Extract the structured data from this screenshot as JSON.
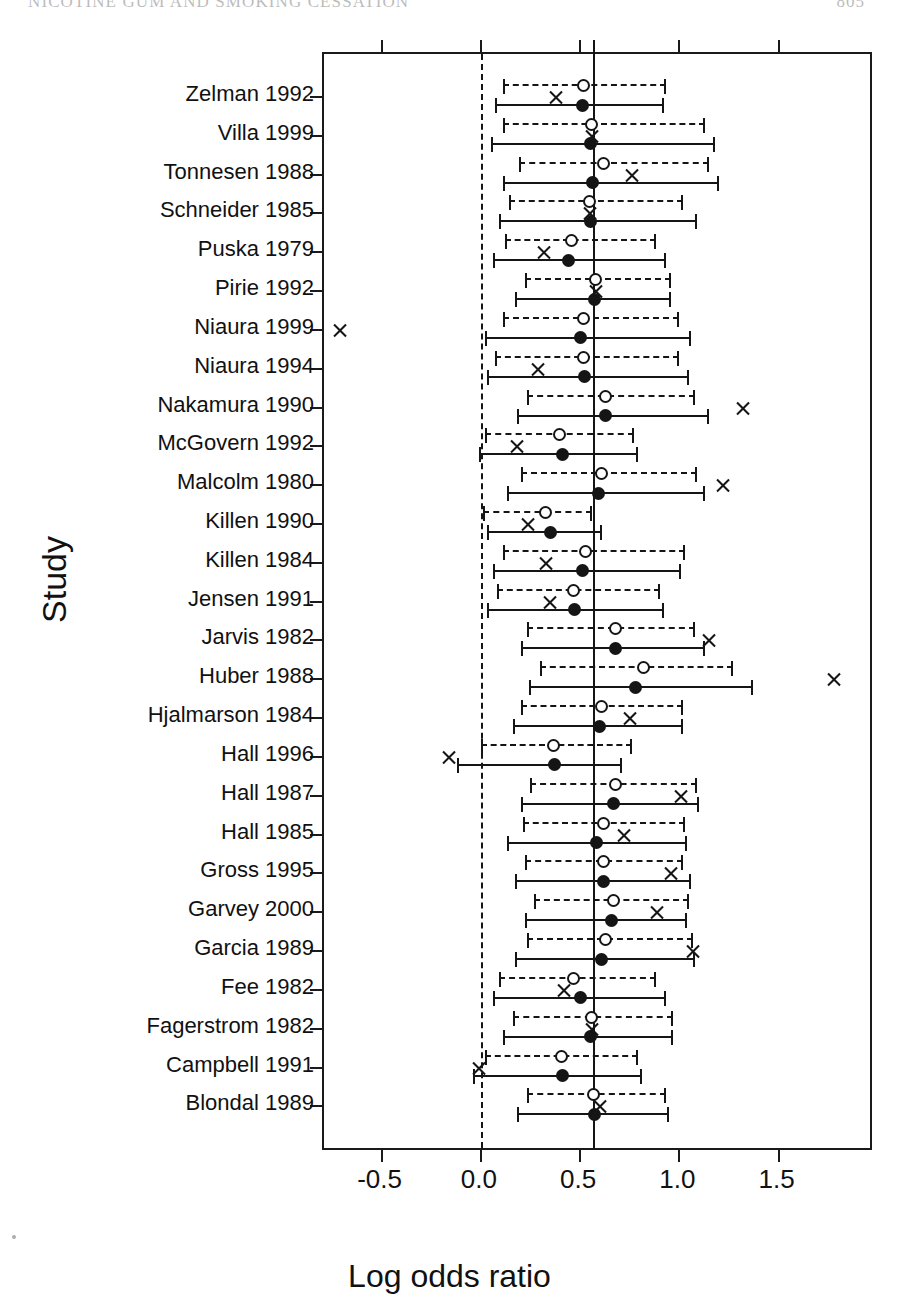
{
  "running_head": {
    "title": "NICOTINE GUM AND SMOKING CESSATION",
    "page": "805"
  },
  "axes": {
    "ylabel": "Study",
    "xlabel": "Log odds ratio",
    "xticks": [
      "-0.5",
      "0.0",
      "0.5",
      "1.0",
      "1.5"
    ],
    "xtick_values": [
      -0.5,
      0.0,
      0.5,
      1.0,
      1.5
    ],
    "xlim": [
      -0.79,
      1.98
    ],
    "reference_line_dashed": 0.0,
    "reference_line_solid": 0.57
  },
  "legend_semantics": {
    "open_circle": "Adjusted / trim-and-fill estimate",
    "filled_circle": "Observed estimate",
    "x_marker": "Influence diagnostic",
    "dashed_line": "Adjusted 95% confidence interval",
    "solid_line": "Observed 95% confidence interval"
  },
  "chart_data": {
    "type": "scatter",
    "title": "",
    "xlabel": "Log odds ratio",
    "ylabel": "Study",
    "xlim": [
      -0.79,
      1.98
    ],
    "grid": false,
    "legend_position": "none",
    "categories": [
      "Zelman 1992",
      "Villa 1999",
      "Tonnesen 1988",
      "Schneider 1985",
      "Puska 1979",
      "Pirie 1992",
      "Niaura 1999",
      "Niaura 1994",
      "Nakamura 1990",
      "McGovern 1992",
      "Malcolm 1980",
      "Killen 1990",
      "Killen 1984",
      "Jensen 1991",
      "Jarvis 1982",
      "Huber 1988",
      "Hjalmarson 1984",
      "Hall 1996",
      "Hall 1987",
      "Hall 1985",
      "Gross 1995",
      "Garvey 2000",
      "Garcia 1989",
      "Fee 1982",
      "Fagerstrom 1982",
      "Campbell 1991",
      "Blondal 1989"
    ],
    "series": [
      {
        "name": "Adjusted estimate (open circle, dashed CI)",
        "marker": "open-circle",
        "line": "dashed",
        "points": [
          {
            "study": "Zelman 1992",
            "est": 0.52,
            "lo": 0.11,
            "hi": 0.93
          },
          {
            "study": "Villa 1999",
            "est": 0.56,
            "lo": 0.11,
            "hi": 1.13
          },
          {
            "study": "Tonnesen 1988",
            "est": 0.62,
            "lo": 0.19,
            "hi": 1.15
          },
          {
            "study": "Schneider 1985",
            "est": 0.55,
            "lo": 0.14,
            "hi": 1.02
          },
          {
            "study": "Puska 1979",
            "est": 0.46,
            "lo": 0.12,
            "hi": 0.88
          },
          {
            "study": "Pirie 1992",
            "est": 0.58,
            "lo": 0.22,
            "hi": 0.96
          },
          {
            "study": "Niaura 1999",
            "est": 0.52,
            "lo": 0.11,
            "hi": 1.0
          },
          {
            "study": "Niaura 1994",
            "est": 0.52,
            "lo": 0.07,
            "hi": 1.0
          },
          {
            "study": "Nakamura 1990",
            "est": 0.63,
            "lo": 0.23,
            "hi": 1.08
          },
          {
            "study": "McGovern 1992",
            "est": 0.4,
            "lo": 0.02,
            "hi": 0.77
          },
          {
            "study": "Malcolm 1980",
            "est": 0.61,
            "lo": 0.2,
            "hi": 1.09
          },
          {
            "study": "Killen 1990",
            "est": 0.33,
            "lo": 0.01,
            "hi": 0.56
          },
          {
            "study": "Killen 1984",
            "est": 0.53,
            "lo": 0.11,
            "hi": 1.03
          },
          {
            "study": "Jensen 1991",
            "est": 0.47,
            "lo": 0.08,
            "hi": 0.9
          },
          {
            "study": "Jarvis 1982",
            "est": 0.68,
            "lo": 0.23,
            "hi": 1.08
          },
          {
            "study": "Huber 1988",
            "est": 0.82,
            "lo": 0.3,
            "hi": 1.27
          },
          {
            "study": "Hjalmarson 1984",
            "est": 0.61,
            "lo": 0.2,
            "hi": 1.02
          },
          {
            "study": "Hall 1996",
            "est": 0.37,
            "lo": 0.0,
            "hi": 0.76
          },
          {
            "study": "Hall 1987",
            "est": 0.68,
            "lo": 0.25,
            "hi": 1.09
          },
          {
            "study": "Hall 1985",
            "est": 0.62,
            "lo": 0.21,
            "hi": 1.03
          },
          {
            "study": "Gross 1995",
            "est": 0.62,
            "lo": 0.22,
            "hi": 1.02
          },
          {
            "study": "Garvey 2000",
            "est": 0.67,
            "lo": 0.27,
            "hi": 1.05
          },
          {
            "study": "Garcia 1989",
            "est": 0.63,
            "lo": 0.23,
            "hi": 1.07
          },
          {
            "study": "Fee 1982",
            "est": 0.47,
            "lo": 0.09,
            "hi": 0.88
          },
          {
            "study": "Fagerstrom 1982",
            "est": 0.56,
            "lo": 0.16,
            "hi": 0.97
          },
          {
            "study": "Campbell 1991",
            "est": 0.41,
            "lo": 0.02,
            "hi": 0.79
          },
          {
            "study": "Blondal 1989",
            "est": 0.57,
            "lo": 0.23,
            "hi": 0.93
          }
        ]
      },
      {
        "name": "Observed estimate (filled circle, solid CI)",
        "marker": "filled-circle",
        "line": "solid",
        "points": [
          {
            "study": "Zelman 1992",
            "est": 0.51,
            "lo": 0.07,
            "hi": 0.92
          },
          {
            "study": "Villa 1999",
            "est": 0.55,
            "lo": 0.05,
            "hi": 1.18
          },
          {
            "study": "Tonnesen 1988",
            "est": 0.56,
            "lo": 0.11,
            "hi": 1.2
          },
          {
            "study": "Schneider 1985",
            "est": 0.55,
            "lo": 0.09,
            "hi": 1.09
          },
          {
            "study": "Puska 1979",
            "est": 0.44,
            "lo": 0.06,
            "hi": 0.93
          },
          {
            "study": "Pirie 1992",
            "est": 0.57,
            "lo": 0.17,
            "hi": 0.96
          },
          {
            "study": "Niaura 1999",
            "est": 0.5,
            "lo": 0.02,
            "hi": 1.06
          },
          {
            "study": "Niaura 1994",
            "est": 0.52,
            "lo": 0.03,
            "hi": 1.05
          },
          {
            "study": "Nakamura 1990",
            "est": 0.63,
            "lo": 0.18,
            "hi": 1.15
          },
          {
            "study": "McGovern 1992",
            "est": 0.41,
            "lo": -0.01,
            "hi": 0.79
          },
          {
            "study": "Malcolm 1980",
            "est": 0.59,
            "lo": 0.13,
            "hi": 1.13
          },
          {
            "study": "Killen 1990",
            "est": 0.35,
            "lo": 0.03,
            "hi": 0.61
          },
          {
            "study": "Killen 1984",
            "est": 0.51,
            "lo": 0.06,
            "hi": 1.01
          },
          {
            "study": "Jensen 1991",
            "est": 0.47,
            "lo": 0.03,
            "hi": 0.92
          },
          {
            "study": "Jarvis 1982",
            "est": 0.68,
            "lo": 0.2,
            "hi": 1.13
          },
          {
            "study": "Huber 1988",
            "est": 0.78,
            "lo": 0.24,
            "hi": 1.37
          },
          {
            "study": "Hjalmarson 1984",
            "est": 0.6,
            "lo": 0.16,
            "hi": 1.02
          },
          {
            "study": "Hall 1996",
            "est": 0.37,
            "lo": -0.12,
            "hi": 0.71
          },
          {
            "study": "Hall 1987",
            "est": 0.67,
            "lo": 0.2,
            "hi": 1.1
          },
          {
            "study": "Hall 1985",
            "est": 0.58,
            "lo": 0.13,
            "hi": 1.04
          },
          {
            "study": "Gross 1995",
            "est": 0.62,
            "lo": 0.17,
            "hi": 1.06
          },
          {
            "study": "Garvey 2000",
            "est": 0.66,
            "lo": 0.22,
            "hi": 1.04
          },
          {
            "study": "Garcia 1989",
            "est": 0.61,
            "lo": 0.17,
            "hi": 1.08
          },
          {
            "study": "Fee 1982",
            "est": 0.5,
            "lo": 0.06,
            "hi": 0.93
          },
          {
            "study": "Fagerstrom 1982",
            "est": 0.55,
            "lo": 0.11,
            "hi": 0.97
          },
          {
            "study": "Campbell 1991",
            "est": 0.41,
            "lo": -0.04,
            "hi": 0.81
          },
          {
            "study": "Blondal 1989",
            "est": 0.57,
            "lo": 0.18,
            "hi": 0.95
          }
        ]
      },
      {
        "name": "Influence diagnostic (X)",
        "marker": "x",
        "line": "none",
        "points": [
          {
            "study": "Zelman 1992",
            "est": 0.38
          },
          {
            "study": "Villa 1999",
            "est": 0.56
          },
          {
            "study": "Tonnesen 1988",
            "est": 0.76
          },
          {
            "study": "Schneider 1985",
            "est": 0.55
          },
          {
            "study": "Puska 1979",
            "est": 0.32
          },
          {
            "study": "Pirie 1992",
            "est": 0.58
          },
          {
            "study": "Niaura 1999",
            "est": -0.71
          },
          {
            "study": "Niaura 1994",
            "est": 0.29
          },
          {
            "study": "Nakamura 1990",
            "est": 1.32
          },
          {
            "study": "McGovern 1992",
            "est": 0.18
          },
          {
            "study": "Malcolm 1980",
            "est": 1.22
          },
          {
            "study": "Killen 1990",
            "est": 0.24
          },
          {
            "study": "Killen 1984",
            "est": 0.33
          },
          {
            "study": "Jensen 1991",
            "est": 0.35
          },
          {
            "study": "Jarvis 1982",
            "est": 1.15
          },
          {
            "study": "Huber 1988",
            "est": 1.78
          },
          {
            "study": "Hjalmarson 1984",
            "est": 0.75
          },
          {
            "study": "Hall 1996",
            "est": -0.16
          },
          {
            "study": "Hall 1987",
            "est": 1.01
          },
          {
            "study": "Hall 1985",
            "est": 0.72
          },
          {
            "study": "Gross 1995",
            "est": 0.96
          },
          {
            "study": "Garvey 2000",
            "est": 0.89
          },
          {
            "study": "Garcia 1989",
            "est": 1.07
          },
          {
            "study": "Fee 1982",
            "est": 0.42
          },
          {
            "study": "Fagerstrom 1982",
            "est": 0.56
          },
          {
            "study": "Campbell 1991",
            "est": -0.01
          },
          {
            "study": "Blondal 1989",
            "est": 0.6
          }
        ]
      }
    ]
  }
}
